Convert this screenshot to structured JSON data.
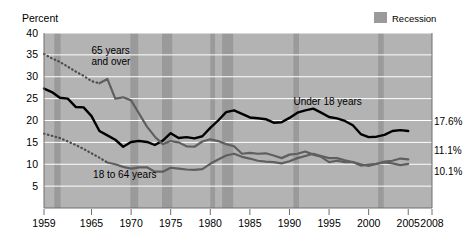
{
  "chart_data": {
    "type": "line",
    "title": "",
    "ylabel": "Percent",
    "xlabel": "",
    "ylim": [
      0,
      40
    ],
    "xlim": [
      1959,
      2008
    ],
    "yticks": [
      5,
      10,
      15,
      20,
      25,
      30,
      35,
      40
    ],
    "xticks": [
      1959,
      1965,
      1970,
      1975,
      1980,
      1985,
      1990,
      1995,
      2000,
      2005,
      2008
    ],
    "grid": "horizontal",
    "legend_position": "top-right",
    "legend": [
      {
        "label": "Recession",
        "color": "#9a9a9a",
        "swatch": "band"
      }
    ],
    "plot_background": "#b3b3b3",
    "recession_bands": [
      {
        "start": 1960.3,
        "end": 1961.1
      },
      {
        "start": 1969.9,
        "end": 1970.9
      },
      {
        "start": 1973.9,
        "end": 1975.2
      },
      {
        "start": 1980.0,
        "end": 1980.6
      },
      {
        "start": 1981.5,
        "end": 1982.9
      },
      {
        "start": 1990.5,
        "end": 1991.2
      },
      {
        "start": 2001.2,
        "end": 2001.9
      }
    ],
    "annotations": [
      {
        "text": "65 years",
        "x": 1965.0,
        "y": 35.3,
        "name": "label-65-and-over-line1"
      },
      {
        "text": "and over",
        "x": 1965.0,
        "y": 32.6,
        "name": "label-65-and-over-line2"
      },
      {
        "text": "Under 18 years",
        "x": 1990.5,
        "y": 23.6,
        "name": "label-under-18"
      },
      {
        "text": "18 to 64 years",
        "x": 1965.2,
        "y": 6.9,
        "name": "label-18-to-64"
      }
    ],
    "end_values": [
      {
        "text": "17.6%",
        "series": "Under 18 years",
        "year": 2005,
        "value": 17.6
      },
      {
        "text": "11.1%",
        "series": "65 years and over",
        "year": 2005,
        "value": 11.1
      },
      {
        "text": "10.1%",
        "series": "18 to 64 years",
        "year": 2005,
        "value": 10.1
      }
    ],
    "series": [
      {
        "name": "Under 18 years",
        "color": "#000000",
        "width": 2.4,
        "style": "solid",
        "x": [
          1959,
          1960,
          1961,
          1962,
          1963,
          1964,
          1965,
          1966,
          1967,
          1968,
          1969,
          1970,
          1971,
          1972,
          1973,
          1974,
          1975,
          1976,
          1977,
          1978,
          1979,
          1980,
          1981,
          1982,
          1983,
          1984,
          1985,
          1986,
          1987,
          1988,
          1989,
          1990,
          1991,
          1992,
          1993,
          1994,
          1995,
          1996,
          1997,
          1998,
          1999,
          2000,
          2001,
          2002,
          2003,
          2004,
          2005
        ],
        "values": [
          27.3,
          26.5,
          25.2,
          25.0,
          23.1,
          23.0,
          21.0,
          17.6,
          16.6,
          15.6,
          14.0,
          15.1,
          15.3,
          15.1,
          14.4,
          15.4,
          17.1,
          16.0,
          16.2,
          15.9,
          16.4,
          18.3,
          20.0,
          21.9,
          22.3,
          21.5,
          20.7,
          20.5,
          20.3,
          19.5,
          19.6,
          20.6,
          21.8,
          22.3,
          22.7,
          21.8,
          20.8,
          20.5,
          19.9,
          18.9,
          16.9,
          16.2,
          16.3,
          16.7,
          17.6,
          17.8,
          17.6
        ]
      },
      {
        "name": "65 years and over (dotted segment)",
        "color": "#4a4a4a",
        "width": 2.2,
        "style": "dotted",
        "x": [
          1959,
          1960,
          1961,
          1962,
          1963,
          1964,
          1965,
          1966
        ],
        "values": [
          35.2,
          34.2,
          33.4,
          32.3,
          31.2,
          30.2,
          29.0,
          28.5
        ]
      },
      {
        "name": "65 years and over",
        "color": "#5f5f5f",
        "width": 2.2,
        "style": "solid",
        "x": [
          1966,
          1967,
          1968,
          1969,
          1970,
          1971,
          1972,
          1973,
          1974,
          1975,
          1976,
          1977,
          1978,
          1979,
          1980,
          1981,
          1982,
          1983,
          1984,
          1985,
          1986,
          1987,
          1988,
          1989,
          1990,
          1991,
          1992,
          1993,
          1994,
          1995,
          1996,
          1997,
          1998,
          1999,
          2000,
          2001,
          2002,
          2003,
          2004,
          2005
        ],
        "values": [
          28.5,
          29.5,
          25.0,
          25.3,
          24.6,
          21.6,
          18.6,
          16.3,
          14.6,
          15.3,
          15.0,
          14.1,
          14.0,
          15.2,
          15.7,
          15.3,
          14.6,
          14.1,
          12.4,
          12.6,
          12.4,
          12.5,
          12.0,
          11.4,
          12.2,
          12.4,
          12.9,
          12.2,
          11.7,
          10.5,
          10.8,
          10.5,
          10.5,
          9.7,
          9.9,
          10.1,
          10.4,
          10.2,
          9.8,
          10.1
        ]
      },
      {
        "name": "18 to 64 years (dotted segment)",
        "color": "#4a4a4a",
        "width": 2.2,
        "style": "dotted",
        "x": [
          1959,
          1960,
          1961,
          1962,
          1963,
          1964,
          1965,
          1966,
          1967
        ],
        "values": [
          17.0,
          16.5,
          16.0,
          15.2,
          14.4,
          13.5,
          12.5,
          11.5,
          10.4
        ]
      },
      {
        "name": "18 to 64 years",
        "color": "#5f5f5f",
        "width": 2.2,
        "style": "solid",
        "x": [
          1967,
          1968,
          1969,
          1970,
          1971,
          1972,
          1973,
          1974,
          1975,
          1976,
          1977,
          1978,
          1979,
          1980,
          1981,
          1982,
          1983,
          1984,
          1985,
          1986,
          1987,
          1988,
          1989,
          1990,
          1991,
          1992,
          1993,
          1994,
          1995,
          1996,
          1997,
          1998,
          1999,
          2000,
          2001,
          2002,
          2003,
          2004,
          2005
        ],
        "values": [
          10.4,
          10.0,
          9.4,
          9.0,
          9.3,
          9.3,
          8.3,
          8.3,
          9.2,
          9.0,
          8.8,
          8.7,
          8.9,
          10.1,
          11.1,
          12.0,
          12.4,
          11.7,
          11.3,
          10.8,
          10.6,
          10.5,
          10.2,
          10.7,
          11.4,
          11.9,
          12.4,
          11.9,
          11.4,
          11.4,
          10.9,
          10.5,
          10.0,
          9.6,
          10.1,
          10.6,
          10.8,
          11.3,
          11.1
        ]
      }
    ]
  },
  "axis": {
    "percent_label": "Percent",
    "ytick_labels": [
      "40",
      "35",
      "30",
      "25",
      "20",
      "15",
      "10",
      "5"
    ],
    "xtick_labels": [
      "1959",
      "1965",
      "1970",
      "1975",
      "1980",
      "1985",
      "1990",
      "1995",
      "2000",
      "2005",
      "2008"
    ]
  },
  "legend": {
    "recession_label": "Recession"
  }
}
